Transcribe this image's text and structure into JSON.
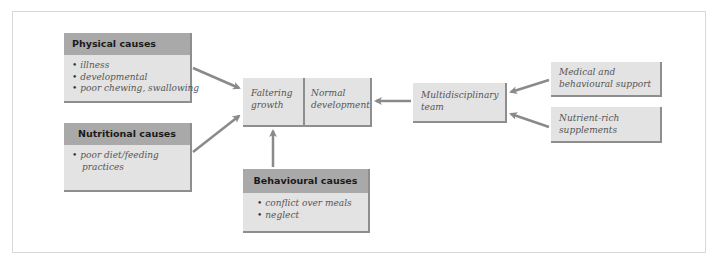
{
  "diagram": {
    "physical_causes": {
      "title": "Physical causes",
      "items": [
        "illness",
        "developmental",
        "poor chewing, swallowing"
      ]
    },
    "nutritional_causes": {
      "title": "Nutritional causes",
      "items": [
        "poor diet/feeding practices"
      ]
    },
    "behavioural_causes": {
      "title": "Behavioural causes",
      "items": [
        "conflict over meals",
        "neglect"
      ]
    },
    "faltering_growth": {
      "line1": "Faltering",
      "line2": "growth"
    },
    "normal_development": {
      "line1": "Normal",
      "line2": "development"
    },
    "multidisciplinary_team": {
      "line1": "Multidisciplinary",
      "line2": "team"
    },
    "medical_support": {
      "line1": "Medical and",
      "line2": "behavioural support"
    },
    "nutrient_supplements": {
      "line1": "Nutrient-rich",
      "line2": "supplements"
    },
    "colors": {
      "header": "#a9a9a9",
      "body": "#e3e3e3",
      "shadow": "#8e8e8e",
      "arrow": "#8a8a8a"
    }
  }
}
